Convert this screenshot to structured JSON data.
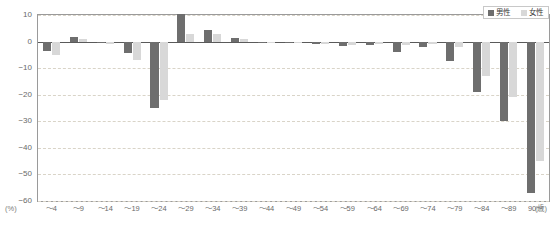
{
  "legend": {
    "male_label": "男性",
    "female_label": "女性",
    "male_color": "#6e6e6e",
    "female_color": "#d8d8d8"
  },
  "axes": {
    "y_unit": "(%)",
    "x_unit": "(歳)",
    "y_ticks": [
      "10",
      "0",
      "-10",
      "-20",
      "-30",
      "-40",
      "-50",
      "-60"
    ]
  },
  "chart_data": {
    "type": "bar",
    "title": "",
    "xlabel": "(歳)",
    "ylabel": "(%)",
    "ylim": [
      -60,
      10
    ],
    "grid": true,
    "legend_position": "top-right",
    "categories": [
      "～4",
      "～9",
      "～14",
      "～19",
      "～24",
      "～29",
      "～34",
      "～39",
      "～44",
      "～49",
      "～54",
      "～59",
      "～64",
      "～69",
      "～74",
      "～79",
      "～84",
      "～89",
      "90～"
    ],
    "series": [
      {
        "name": "男性",
        "color": "#6e6e6e",
        "values": [
          -3.5,
          1.8,
          -0.6,
          -4.2,
          -25.0,
          10.5,
          4.2,
          1.2,
          -0.4,
          -0.6,
          -1.0,
          -1.6,
          -1.2,
          -3.8,
          -2.2,
          -7.5,
          -19.0,
          -30.0,
          -57.0
        ]
      },
      {
        "name": "女性",
        "color": "#d8d8d8",
        "values": [
          -5.0,
          0.8,
          -1.0,
          -7.0,
          -22.0,
          2.8,
          3.0,
          1.0,
          -0.3,
          -0.5,
          -0.8,
          -1.2,
          -1.0,
          -1.2,
          -0.8,
          -2.2,
          -13.0,
          -21.0,
          -45.0
        ]
      }
    ]
  }
}
